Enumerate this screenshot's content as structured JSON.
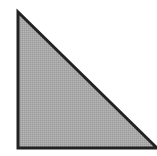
{
  "diagram": {
    "shape": "right-triangle",
    "vertices": [
      [
        18,
        12
      ],
      [
        18,
        148
      ],
      [
        157,
        148
      ]
    ],
    "fill_color": "#a9a9a9",
    "stroke_color": "#222222",
    "stroke_width": 3,
    "background": "#ffffff"
  }
}
